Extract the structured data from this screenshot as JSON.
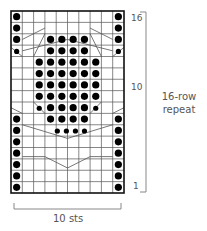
{
  "chart": {
    "columns": 10,
    "rows": 16,
    "cell_symbol": "knit stitch (empty square)",
    "dot_symbol": "purl stitch (filled dot)",
    "row_labels": [
      {
        "row": 16,
        "text": "16"
      },
      {
        "row": 10,
        "text": "10"
      },
      {
        "row": 1,
        "text": "1"
      }
    ],
    "repeat_label_line1": "16-row",
    "repeat_label_line2": "repeat",
    "width_label": "10 sts",
    "dots_by_row_from_top": [
      {
        "row": 16,
        "big": [
          1,
          10
        ],
        "small": []
      },
      {
        "row": 15,
        "big": [
          1,
          10
        ],
        "small": []
      },
      {
        "row": 14,
        "big": [
          1,
          10,
          4,
          5,
          6,
          7
        ],
        "small": []
      },
      {
        "row": 13,
        "big": [
          4,
          5,
          6,
          7
        ],
        "small": [
          1,
          10
        ]
      },
      {
        "row": 12,
        "big": [
          3,
          4,
          5,
          6,
          7,
          8
        ],
        "small": []
      },
      {
        "row": 11,
        "big": [
          3,
          4,
          5,
          6,
          7,
          8
        ],
        "small": []
      },
      {
        "row": 10,
        "big": [
          3,
          4,
          5,
          6,
          7,
          8
        ],
        "small": []
      },
      {
        "row": 9,
        "big": [
          3,
          4,
          5,
          6,
          7,
          8
        ],
        "small": []
      },
      {
        "row": 8,
        "big": [
          4,
          5,
          6,
          7
        ],
        "small": [
          3,
          8
        ]
      },
      {
        "row": 7,
        "big": [
          1,
          10,
          4,
          5,
          6,
          7
        ],
        "small": []
      },
      {
        "row": 6,
        "big": [
          1,
          10
        ],
        "small": [
          4.6,
          5.4,
          6.2,
          7
        ]
      },
      {
        "row": 5,
        "big": [
          1,
          10
        ],
        "small": []
      },
      {
        "row": 4,
        "big": [
          1,
          10
        ],
        "small": []
      },
      {
        "row": 3,
        "big": [
          1,
          10
        ],
        "small": []
      },
      {
        "row": 2,
        "big": [
          1,
          10
        ],
        "small": []
      },
      {
        "row": 1,
        "big": [
          1,
          10
        ],
        "small": []
      }
    ],
    "colors": {
      "grid": "#555555",
      "border": "#111111",
      "dot": "#000000",
      "bracket": "#888888",
      "text": "#555555"
    }
  }
}
